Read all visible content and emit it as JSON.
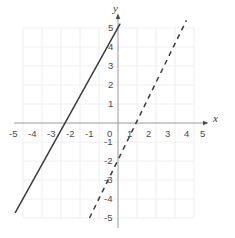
{
  "chart_data": {
    "type": "line",
    "title": "",
    "subtitle": "",
    "xlabel": "x",
    "ylabel": "y",
    "xlim": [
      -5,
      5
    ],
    "ylim": [
      -5,
      5
    ],
    "grid": true,
    "grid_color": "#ececf0",
    "axis_color": "#9a9a9a",
    "legend": "none",
    "x_ticks": [
      "-5",
      "-4",
      "-3",
      "-2",
      "-1",
      "0",
      "1",
      "2",
      "3",
      "4",
      "5"
    ],
    "x_tick_values": [
      -5,
      -4,
      -3,
      -2,
      -1,
      0,
      1,
      2,
      3,
      4,
      5
    ],
    "y_ticks": [
      "5",
      "4",
      "3",
      "2",
      "1",
      "-1",
      "-2",
      "-3",
      "-4",
      "-5"
    ],
    "y_tick_values": [
      5,
      4,
      3,
      2,
      1,
      -1,
      -2,
      -3,
      -4,
      -5
    ],
    "origin_label": "0",
    "series": [
      {
        "name": "solid-line",
        "style": "solid",
        "color": "#3c3c3c",
        "slope": 1.8,
        "intercept": 5,
        "x_intercept": -2.8,
        "y_intercept": 5,
        "x_start": -5.4,
        "y_start": -4.7,
        "x_end": 0.1,
        "y_end": 5.2
      },
      {
        "name": "dashed-line",
        "style": "dashed",
        "color": "#3c3c3c",
        "slope": 2,
        "intercept": -2,
        "x_intercept": 1,
        "y_intercept": -2,
        "x_start": -1.5,
        "y_start": -5,
        "x_end": 3.6,
        "y_end": 5.4
      }
    ]
  },
  "axes": {
    "x_axis_label": "x",
    "y_axis_label": "y"
  }
}
